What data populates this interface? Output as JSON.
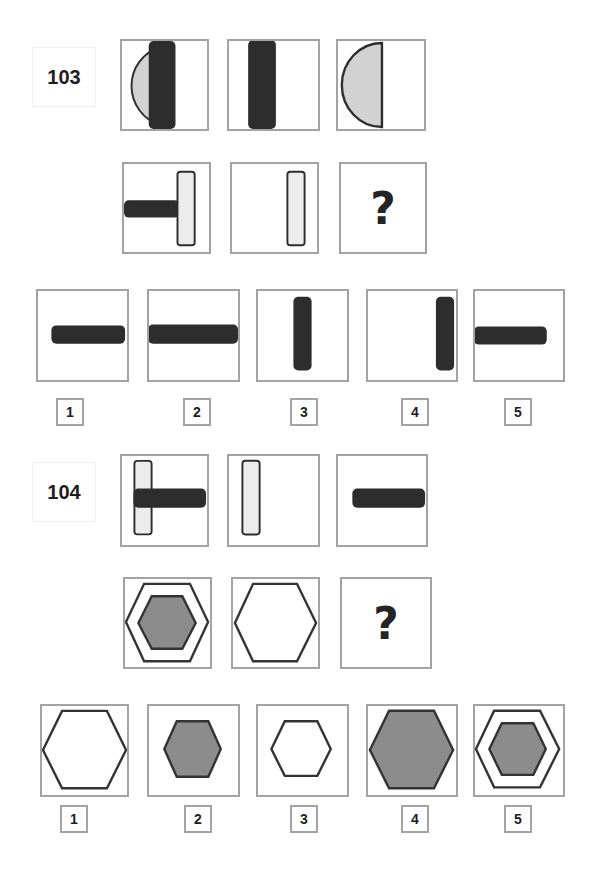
{
  "colors": {
    "frame": "#a3a3a3",
    "dark_bar": "#2d2d2d",
    "light_fill": "#d2d2d2",
    "pale_fill": "#ececec",
    "hex_fill": "#8c8c8c",
    "stroke": "#333333"
  },
  "problems": [
    {
      "number": "103",
      "matrix_rows": [
        [
          "semicircle-left + vertical-dark-bar",
          "vertical-dark-bar",
          "semicircle-left"
        ],
        [
          "horizontal-dark-bar + vertical-light-bar-right",
          "vertical-light-bar-right",
          "?"
        ]
      ],
      "question_mark": "?",
      "options": [
        {
          "label": "1",
          "shape": "horizontal-dark-bar-center"
        },
        {
          "label": "2",
          "shape": "horizontal-dark-bar-full-width"
        },
        {
          "label": "3",
          "shape": "vertical-dark-bar-center"
        },
        {
          "label": "4",
          "shape": "vertical-dark-bar-right"
        },
        {
          "label": "5",
          "shape": "horizontal-dark-bar-left"
        }
      ]
    },
    {
      "number": "104",
      "matrix_rows": [
        [
          "vertical-light-bar-left + horizontal-dark-bar",
          "vertical-light-bar-left",
          "horizontal-dark-bar-right"
        ],
        [
          "outline-hexagon + inner-gray-hexagon",
          "outline-hexagon-large",
          "?"
        ]
      ],
      "question_mark": "?",
      "options": [
        {
          "label": "1",
          "shape": "outline-hexagon-large"
        },
        {
          "label": "2",
          "shape": "gray-hexagon-medium"
        },
        {
          "label": "3",
          "shape": "outline-hexagon-small"
        },
        {
          "label": "4",
          "shape": "gray-hexagon-large"
        },
        {
          "label": "5",
          "shape": "outline-hexagon + inner-gray-hexagon"
        }
      ]
    }
  ]
}
